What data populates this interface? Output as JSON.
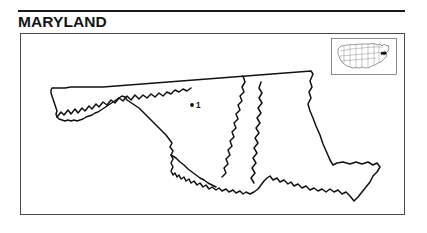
{
  "page": {
    "title": "MARYLAND",
    "background_color": "#ffffff",
    "ink_color": "#111111"
  },
  "title_rule": {
    "name": "title-rule",
    "color": "#1a1a1a"
  },
  "map_frame": {
    "border_color": "#4a4a4a",
    "fill_color": "#ffffff"
  },
  "state_map": {
    "state_name": "MARYLAND",
    "outline_color": "#111111",
    "fill_color": "#ffffff",
    "description": "Outline map of the State of Maryland showing the western panhandle, the Potomac River southern border, Chesapeake Bay and the Eastern Shore."
  },
  "markers": [
    {
      "id": "1",
      "label": "1",
      "dot_color": "#111111",
      "x": 192,
      "y": 104
    }
  ],
  "locator_inset": {
    "name": "united-states-locator-map",
    "outline_color": "#555555",
    "highlight_color": "#000000",
    "highlight_state": "MARYLAND",
    "border_color": "#5a5a5a"
  }
}
